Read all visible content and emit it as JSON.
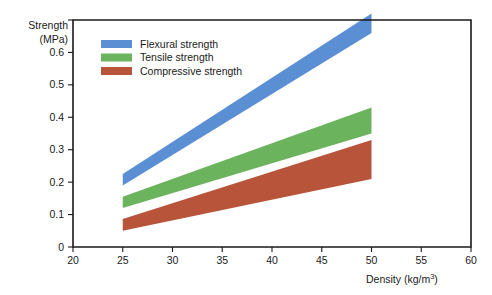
{
  "chart_data": {
    "type": "area",
    "title": "",
    "xlabel": "Density (kg/m3)",
    "xlabel_display": "Density (kg/m",
    "xlabel_sup": "3",
    "xlabel_tail": ")",
    "ylabel_line1": "Strength",
    "ylabel_line2": "(MPa)",
    "xlim": [
      20,
      60
    ],
    "ylim": [
      0,
      0.7
    ],
    "x_ticks": [
      20,
      25,
      30,
      35,
      40,
      45,
      50,
      55,
      60
    ],
    "x_tick_labels": [
      "20",
      "25",
      "30",
      "35",
      "40",
      "45",
      "50",
      "55",
      "60"
    ],
    "y_ticks": [
      0,
      0.1,
      0.2,
      0.3,
      0.4,
      0.5,
      0.6,
      0.7
    ],
    "y_tick_labels": [
      "0",
      "0.1",
      "0.2",
      "0.3",
      "0.4",
      "0.5",
      "0.6",
      "0.7"
    ],
    "y_tick_labels_visible": [
      "0",
      "0.1",
      "0.2",
      "0.3",
      "0.4",
      "0.5",
      "0.6",
      ""
    ],
    "grid": false,
    "legend_position": "top-left-inside",
    "series": [
      {
        "name": "Flexural strength",
        "color": "#5b8fd4",
        "x_range": [
          25,
          50
        ],
        "lower": [
          0.19,
          0.66
        ],
        "upper": [
          0.225,
          0.72
        ]
      },
      {
        "name": "Tensile strength",
        "color": "#6cb35e",
        "x_range": [
          25,
          50
        ],
        "lower": [
          0.12,
          0.35
        ],
        "upper": [
          0.155,
          0.43
        ]
      },
      {
        "name": "Compressive strength",
        "color": "#b8543a",
        "x_range": [
          25,
          50
        ],
        "lower": [
          0.05,
          0.21
        ],
        "upper": [
          0.086,
          0.33
        ]
      }
    ]
  },
  "legend": {
    "items": [
      {
        "label": "Flexural strength",
        "color": "#5b8fd4"
      },
      {
        "label": "Tensile strength",
        "color": "#6cb35e"
      },
      {
        "label": "Compressive strength",
        "color": "#b8543a"
      }
    ]
  },
  "colors": {
    "flexural": "#5b8fd4",
    "tensile": "#6cb35e",
    "compressive": "#b8543a",
    "axis": "#1a1a1a",
    "background": "#ffffff"
  }
}
